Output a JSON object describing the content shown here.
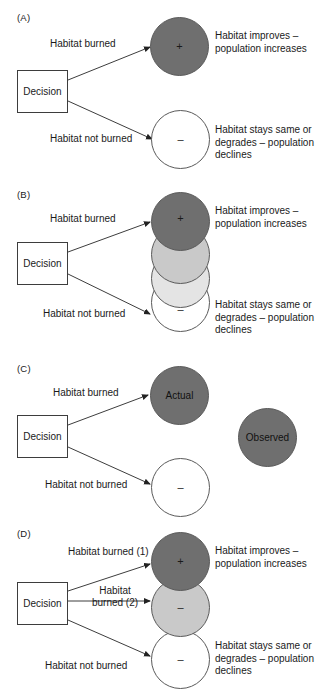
{
  "figure": {
    "colors": {
      "dark_gray": "#6f6f6f",
      "mid_gray": "#9a9a9a",
      "light_gray": "#c9c9c9",
      "pale_gray": "#e4e4e4",
      "white": "#ffffff",
      "stroke": "#5a5a5a",
      "text": "#1a1a1a"
    }
  },
  "panels": [
    {
      "id": "A",
      "label": "(A)",
      "decision": "Decision",
      "edges": [
        {
          "name": "habitat-burned",
          "text": "Habitat burned"
        },
        {
          "name": "habitat-not-burned",
          "text": "Habitat not burned"
        }
      ],
      "circles": [
        {
          "name": "outcome-positive",
          "symbol": "+",
          "fill": "#6f6f6f"
        },
        {
          "name": "outcome-negative",
          "symbol": "–",
          "fill": "#ffffff"
        }
      ],
      "outcomes": [
        {
          "name": "outcome-text-improves",
          "text": "Habitat improves – population increases"
        },
        {
          "name": "outcome-text-degrades",
          "text": "Habitat stays same or degrades – population declines"
        }
      ]
    },
    {
      "id": "B",
      "label": "(B)",
      "decision": "Decision",
      "edges": [
        {
          "name": "habitat-burned",
          "text": "Habitat burned"
        },
        {
          "name": "habitat-not-burned",
          "text": "Habitat not burned"
        }
      ],
      "circles": [
        {
          "name": "outcome-positive",
          "symbol": "+",
          "fill": "#6f6f6f"
        },
        {
          "name": "outcome-uncertain-1",
          "symbol": "",
          "fill": "#9a9a9a"
        },
        {
          "name": "outcome-uncertain-2",
          "symbol": "",
          "fill": "#c9c9c9"
        },
        {
          "name": "outcome-negative",
          "symbol": "–",
          "fill": "#ffffff"
        }
      ],
      "outcomes": [
        {
          "name": "outcome-text-improves",
          "text": "Habitat improves – population increases"
        },
        {
          "name": "outcome-text-degrades",
          "text": "Habitat stays same or degrades – population declines"
        }
      ]
    },
    {
      "id": "C",
      "label": "(C)",
      "decision": "Decision",
      "edges": [
        {
          "name": "habitat-burned",
          "text": "Habitat burned"
        },
        {
          "name": "habitat-not-burned",
          "text": "Habitat not burned"
        }
      ],
      "circles": [
        {
          "name": "outcome-actual",
          "symbol": "Actual",
          "fill": "#6f6f6f"
        },
        {
          "name": "outcome-negative",
          "symbol": "–",
          "fill": "#ffffff"
        },
        {
          "name": "outcome-observed",
          "symbol": "Observed",
          "fill": "#6f6f6f"
        }
      ],
      "outcomes": []
    },
    {
      "id": "D",
      "label": "(D)",
      "decision": "Decision",
      "edges": [
        {
          "name": "habitat-burned-1",
          "text": "Habitat burned (1)"
        },
        {
          "name": "habitat-burned-2",
          "text": "Habitat burned (2)"
        },
        {
          "name": "habitat-not-burned",
          "text": "Habitat not burned"
        }
      ],
      "circles": [
        {
          "name": "outcome-positive",
          "symbol": "+",
          "fill": "#6f6f6f"
        },
        {
          "name": "outcome-mixed",
          "symbol": "–",
          "fill": "#c9c9c9"
        },
        {
          "name": "outcome-negative",
          "symbol": "–",
          "fill": "#ffffff"
        }
      ],
      "outcomes": [
        {
          "name": "outcome-text-improves",
          "text": "Habitat improves – population increases"
        },
        {
          "name": "outcome-text-degrades",
          "text": "Habitat stays same or degrades – population declines"
        }
      ]
    }
  ]
}
